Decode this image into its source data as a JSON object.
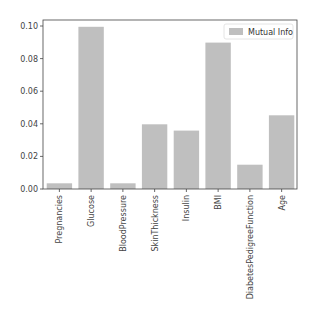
{
  "chart_data": {
    "type": "bar",
    "title": "",
    "xlabel": "",
    "ylabel": "",
    "categories": [
      "Pregnancies",
      "Glucose",
      "BloodPressure",
      "SkinThickness",
      "Insulin",
      "BMI",
      "DiabetesPedigreeFunction",
      "Age"
    ],
    "series": [
      {
        "name": "Mutual Info",
        "values": [
          0.0035,
          0.0995,
          0.0035,
          0.0397,
          0.0358,
          0.0898,
          0.0149,
          0.0452
        ],
        "color": "#bfbfbf"
      }
    ],
    "ylim": [
      0,
      0.1037
    ],
    "yticks": [
      "0.00",
      "0.02",
      "0.04",
      "0.06",
      "0.08",
      "0.10"
    ],
    "ytick_values": [
      0,
      0.02,
      0.04,
      0.06,
      0.08,
      0.1
    ],
    "grid": false,
    "legend_position": "upper right",
    "xtick_rotation": 90
  }
}
